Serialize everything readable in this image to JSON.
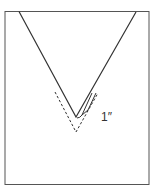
{
  "diagram": {
    "measurement_label": "1″",
    "colors": {
      "line": "#3a3a3a",
      "frame": "#555555",
      "background": "#ffffff"
    }
  }
}
